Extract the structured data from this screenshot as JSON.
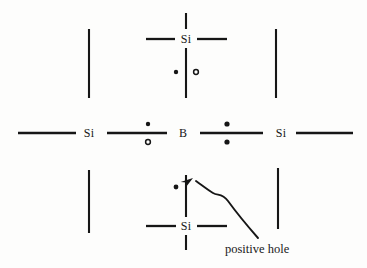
{
  "figure": {
    "kind": "semiconductor-doping-lattice-diagram",
    "background_color": "#fdfdfc",
    "ink_color": "#161616",
    "width": 367,
    "height": 268
  },
  "atoms": [
    {
      "id": "si-top",
      "label": "Si",
      "x": 186,
      "y": 39
    },
    {
      "id": "si-left",
      "label": "Si",
      "x": 89,
      "y": 133
    },
    {
      "id": "boron",
      "label": "B",
      "x": 183,
      "y": 133
    },
    {
      "id": "si-right",
      "label": "Si",
      "x": 281,
      "y": 133
    },
    {
      "id": "si-bottom",
      "label": "Si",
      "x": 186,
      "y": 226
    }
  ],
  "bonds": [
    {
      "id": "bond-top-vertical-stub",
      "orientation": "vertical",
      "x1": 186,
      "y1": 13,
      "x2": 186,
      "y2": 29
    },
    {
      "id": "bond-top-left-arm",
      "orientation": "horizontal",
      "x1": 146,
      "y1": 39,
      "x2": 175,
      "y2": 39
    },
    {
      "id": "bond-top-right-arm",
      "orientation": "horizontal",
      "x1": 197,
      "y1": 39,
      "x2": 227,
      "y2": 39
    },
    {
      "id": "bond-si-top-to-boron",
      "orientation": "vertical",
      "x1": 186,
      "y1": 48,
      "x2": 186,
      "y2": 98
    },
    {
      "id": "bond-outer-top-left",
      "orientation": "vertical",
      "x1": 89,
      "y1": 29,
      "x2": 89,
      "y2": 98
    },
    {
      "id": "bond-outer-top-right",
      "orientation": "vertical",
      "x1": 276,
      "y1": 29,
      "x2": 276,
      "y2": 98
    },
    {
      "id": "bond-far-left-arm",
      "orientation": "horizontal",
      "x1": 18,
      "y1": 133,
      "x2": 76,
      "y2": 133
    },
    {
      "id": "bond-siLeft-to-boron",
      "orientation": "horizontal",
      "x1": 107,
      "y1": 133,
      "x2": 167,
      "y2": 133
    },
    {
      "id": "bond-boron-to-siRight",
      "orientation": "horizontal",
      "x1": 200,
      "y1": 133,
      "x2": 263,
      "y2": 133
    },
    {
      "id": "bond-far-right-arm",
      "orientation": "horizontal",
      "x1": 296,
      "y1": 133,
      "x2": 353,
      "y2": 133
    },
    {
      "id": "bond-boron-to-si-bottom",
      "orientation": "vertical",
      "x1": 186,
      "y1": 175,
      "x2": 186,
      "y2": 217
    },
    {
      "id": "bond-bottom-left-arm",
      "orientation": "horizontal",
      "x1": 146,
      "y1": 226,
      "x2": 176,
      "y2": 226
    },
    {
      "id": "bond-bottom-right-arm",
      "orientation": "horizontal",
      "x1": 197,
      "y1": 226,
      "x2": 227,
      "y2": 226
    },
    {
      "id": "bond-bottom-vertical-stub",
      "orientation": "vertical",
      "x1": 186,
      "y1": 235,
      "x2": 186,
      "y2": 250
    },
    {
      "id": "bond-outer-bottom-left",
      "orientation": "vertical",
      "x1": 89,
      "y1": 170,
      "x2": 89,
      "y2": 233
    },
    {
      "id": "bond-outer-bottom-right",
      "orientation": "vertical",
      "x1": 278,
      "y1": 168,
      "x2": 278,
      "y2": 229
    }
  ],
  "electrons": [
    {
      "id": "electron-top-left",
      "style": "filled",
      "x": 176,
      "y": 72,
      "r": 2.2
    },
    {
      "id": "electron-top-right",
      "style": "hollow",
      "x": 196,
      "y": 72,
      "r": 2.4
    },
    {
      "id": "electron-left-bond-above",
      "style": "filled",
      "x": 148,
      "y": 124,
      "r": 2.2
    },
    {
      "id": "electron-left-bond-below",
      "style": "hollow",
      "x": 148,
      "y": 142,
      "r": 2.4
    },
    {
      "id": "electron-right-bond-above",
      "style": "filled",
      "x": 227,
      "y": 124,
      "r": 2.6
    },
    {
      "id": "electron-right-bond-below",
      "style": "filled",
      "x": 227,
      "y": 142,
      "r": 2.6
    },
    {
      "id": "electron-bottom-left",
      "style": "filled",
      "x": 176,
      "y": 187,
      "r": 2.4
    }
  ],
  "callout": {
    "id": "positive-hole-callout",
    "label": "positive hole",
    "label_x": 225,
    "label_y": 243,
    "arrow_path": "M 258 238 C 244 222 236 212 228 201 C 222 193 218 196 213 193 C 208 190 203 186 196 181",
    "arrow_tip": {
      "x": 193,
      "y": 178
    },
    "arrow_angle_deg": 215
  },
  "missing_electron_note": {
    "description": "vacant electron site beside lower bond indicating the positive hole"
  }
}
